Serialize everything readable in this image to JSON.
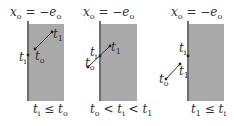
{
  "colors": {
    "shade": "#a9a9a9",
    "wall": "#333333",
    "segment": "#333333",
    "text": "#333333",
    "background": "#ffffff"
  },
  "panels": [
    {
      "header": {
        "var": "x",
        "var_sub": "o",
        "eq": " = −",
        "rhs": "e",
        "rhs_sub": "o"
      },
      "labels": {
        "ti": {
          "main": "t",
          "sub": "i"
        },
        "to": {
          "main": "t",
          "sub": "o"
        },
        "t1": {
          "main": "t",
          "sub": "1"
        }
      },
      "condition": {
        "a": "t",
        "a_sub": "i",
        "op": " ≤ ",
        "b": "t",
        "b_sub": "o"
      }
    },
    {
      "header": {
        "var": "x",
        "var_sub": "o",
        "eq": " = −",
        "rhs": "e",
        "rhs_sub": "o"
      },
      "labels": {
        "ti": {
          "main": "t",
          "sub": "i"
        },
        "to": {
          "main": "t",
          "sub": "o"
        },
        "t1": {
          "main": "t",
          "sub": "1"
        }
      },
      "condition": {
        "a": "t",
        "a_sub": "o",
        "op": " < ",
        "b": "t",
        "b_sub": "i",
        "op2": " < ",
        "c": "t",
        "c_sub": "1"
      }
    },
    {
      "header": {
        "var": "x",
        "var_sub": "o",
        "eq": " = −",
        "rhs": "e",
        "rhs_sub": "o"
      },
      "labels": {
        "ti": {
          "main": "t",
          "sub": "i"
        },
        "to": {
          "main": "t",
          "sub": "o"
        },
        "t1": {
          "main": "t",
          "sub": "1"
        }
      },
      "condition": {
        "a": "t",
        "a_sub": "1",
        "op": " ≤ ",
        "b": "t",
        "b_sub": "i"
      }
    }
  ]
}
